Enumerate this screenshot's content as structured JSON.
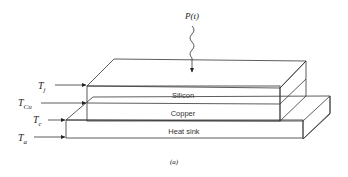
{
  "diagram": {
    "power_label": "P(t)",
    "layers": [
      {
        "name": "silicon",
        "label": "Silicon"
      },
      {
        "name": "copper",
        "label": "Copper"
      },
      {
        "name": "heat-sink",
        "label": "Heat sink"
      }
    ],
    "temperatures": [
      {
        "symbol": "T",
        "sub": "j"
      },
      {
        "symbol": "T",
        "sub": "Cu"
      },
      {
        "symbol": "T",
        "sub": "c"
      },
      {
        "symbol": "T",
        "sub": "a"
      }
    ],
    "caption": "(a)"
  }
}
